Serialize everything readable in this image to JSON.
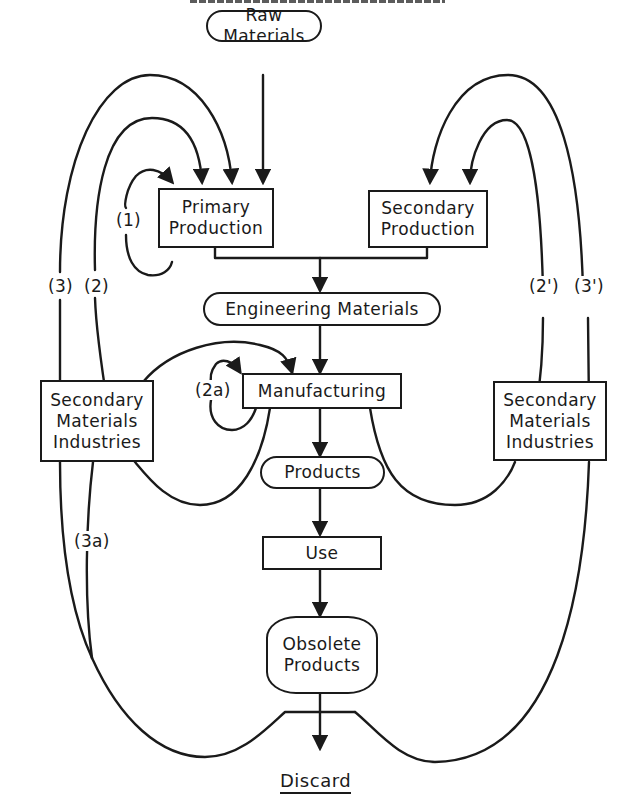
{
  "diagram": {
    "title_clipped": "",
    "nodes": {
      "raw_materials": "Raw Materials",
      "primary_production": [
        "Primary",
        "Production"
      ],
      "secondary_production": [
        "Secondary",
        "Production"
      ],
      "engineering_materials": "Engineering Materials",
      "manufacturing": "Manufacturing",
      "products": "Products",
      "use": "Use",
      "obsolete_products": [
        "Obsolete",
        "Products"
      ],
      "discard": "Discard",
      "smi_left": [
        "Secondary",
        "Materials",
        "Industries"
      ],
      "smi_right": [
        "Secondary",
        "Materials",
        "Industries"
      ]
    },
    "loop_labels": {
      "loop_1": "(1)",
      "loop_2": "(2)",
      "loop_3": "(3)",
      "loop_2a": "(2a)",
      "loop_3a": "(3a)",
      "loop_2prime": "(2')",
      "loop_3prime": "(3')"
    },
    "colors": {
      "ink": "#1a1a1a",
      "background": "#ffffff"
    }
  }
}
